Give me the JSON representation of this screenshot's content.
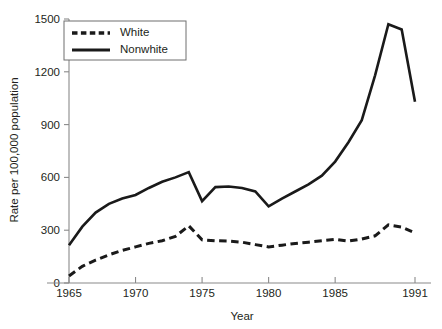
{
  "chart_data": {
    "type": "line",
    "title": "",
    "xlabel": "Year",
    "ylabel": "Rate per 100,000 population",
    "xlim": [
      1965,
      1991
    ],
    "ylim": [
      0,
      1500
    ],
    "grid": false,
    "legend_position": "top-left",
    "x_ticks": [
      1965,
      1970,
      1975,
      1980,
      1985,
      1991
    ],
    "x_tick_labels": [
      "1965",
      "1970",
      "1975",
      "1980",
      "1985",
      "1991"
    ],
    "y_ticks": [
      0,
      300,
      600,
      900,
      1200,
      1500
    ],
    "y_tick_labels": [
      "0",
      "300",
      "600",
      "900",
      "1200",
      "1500"
    ],
    "x": [
      1965,
      1966,
      1967,
      1968,
      1969,
      1970,
      1971,
      1972,
      1973,
      1974,
      1975,
      1976,
      1977,
      1978,
      1979,
      1980,
      1981,
      1982,
      1983,
      1984,
      1985,
      1986,
      1987,
      1988,
      1989,
      1990,
      1991
    ],
    "series": [
      {
        "name": "White",
        "style": "dashed",
        "color": "#1a1a1a",
        "values": [
          40,
          95,
          130,
          160,
          185,
          205,
          225,
          240,
          265,
          325,
          245,
          240,
          238,
          232,
          218,
          205,
          215,
          225,
          232,
          240,
          248,
          238,
          250,
          268,
          330,
          318,
          285
        ]
      },
      {
        "name": "Nonwhite",
        "style": "solid",
        "color": "#1a1a1a",
        "values": [
          215,
          320,
          400,
          450,
          480,
          500,
          540,
          575,
          600,
          630,
          465,
          545,
          548,
          540,
          520,
          435,
          480,
          520,
          560,
          610,
          690,
          800,
          925,
          1180,
          1470,
          1440,
          1030
        ]
      }
    ]
  },
  "legend": {
    "entries": [
      {
        "label": "White",
        "style": "dashed"
      },
      {
        "label": "Nonwhite",
        "style": "solid"
      }
    ]
  }
}
